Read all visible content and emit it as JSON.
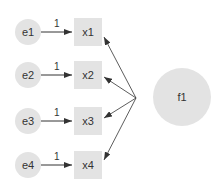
{
  "diagram": {
    "type": "path-diagram",
    "colors": {
      "node_fill": "#e3e3e3",
      "edge": "#333333",
      "text": "#333333"
    },
    "factor": {
      "label": "f1"
    },
    "errors": [
      {
        "label": "e1"
      },
      {
        "label": "e2"
      },
      {
        "label": "e3"
      },
      {
        "label": "e4"
      }
    ],
    "indicators": [
      {
        "label": "x1"
      },
      {
        "label": "x2"
      },
      {
        "label": "x3"
      },
      {
        "label": "x4"
      }
    ],
    "error_weights": [
      "1",
      "1",
      "1",
      "1"
    ]
  }
}
